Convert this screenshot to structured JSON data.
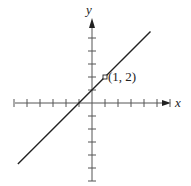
{
  "chart_data": {
    "type": "line",
    "title": "",
    "xlabel": "x",
    "ylabel": "y",
    "equation": "y = x + 1",
    "series": [
      {
        "name": "line",
        "x": [
          -5.7,
          4.5
        ],
        "y": [
          -4.7,
          5.5
        ]
      }
    ],
    "annotations": [
      {
        "x": 1,
        "y": 2,
        "label": "(1, 2)",
        "marker": "open-square"
      }
    ],
    "xticks": [
      -6,
      -5,
      -4,
      -3,
      -2,
      -1,
      1,
      2,
      3,
      4,
      5,
      6
    ],
    "yticks": [
      -6,
      -5,
      -4,
      -3,
      -2,
      -1,
      1,
      2,
      3,
      4,
      5
    ],
    "xlim": [
      -6,
      6.5
    ],
    "ylim": [
      -6,
      6.5
    ],
    "grid": false,
    "legend": "none",
    "colors": {
      "line": "#222222",
      "axis": "#555555"
    }
  },
  "labels": {
    "x_axis": "x",
    "y_axis": "y",
    "point": "(1, 2)"
  }
}
